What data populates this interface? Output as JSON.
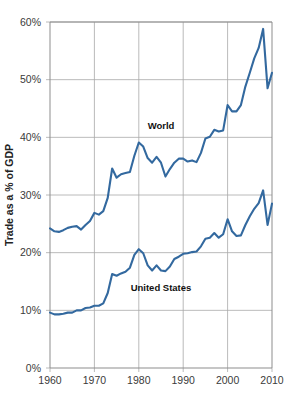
{
  "chart_data": {
    "type": "line",
    "title": "",
    "xlabel": "",
    "ylabel": "Trade as a % of GDP",
    "xlim": [
      1960,
      2010
    ],
    "ylim": [
      0,
      60
    ],
    "xticks": [
      1960,
      1970,
      1980,
      1990,
      2000,
      2010
    ],
    "xtick_labels": [
      "1960",
      "1970",
      "1980",
      "1990",
      "2000",
      "2010"
    ],
    "yticks": [
      0,
      10,
      20,
      30,
      40,
      50,
      60
    ],
    "ytick_labels": [
      "0%",
      "10%",
      "20%",
      "30%",
      "40%",
      "50%",
      "60%"
    ],
    "grid": true,
    "legend_position": "inline-annotations",
    "line_color": "#33699f",
    "series": [
      {
        "name": "World",
        "label": "World",
        "label_x": 1985,
        "label_y": 41.5,
        "x": [
          1960,
          1961,
          1962,
          1963,
          1964,
          1965,
          1966,
          1967,
          1968,
          1969,
          1970,
          1971,
          1972,
          1973,
          1974,
          1975,
          1976,
          1977,
          1978,
          1979,
          1980,
          1981,
          1982,
          1983,
          1984,
          1985,
          1986,
          1987,
          1988,
          1989,
          1990,
          1991,
          1992,
          1993,
          1994,
          1995,
          1996,
          1997,
          1998,
          1999,
          2000,
          2001,
          2002,
          2003,
          2004,
          2005,
          2006,
          2007,
          2008,
          2009,
          2010
        ],
        "values": [
          24.2,
          23.7,
          23.6,
          23.9,
          24.3,
          24.5,
          24.6,
          24.0,
          24.8,
          25.5,
          26.9,
          26.6,
          27.2,
          29.5,
          34.6,
          33.0,
          33.6,
          33.8,
          34.0,
          36.8,
          39.1,
          38.4,
          36.4,
          35.6,
          36.6,
          35.6,
          33.2,
          34.5,
          35.6,
          36.3,
          36.3,
          35.8,
          36.0,
          35.7,
          37.3,
          39.8,
          40.1,
          41.3,
          41.0,
          41.2,
          45.6,
          44.5,
          44.5,
          45.6,
          48.8,
          51.2,
          53.7,
          55.5,
          58.8,
          48.5,
          51.2
        ]
      },
      {
        "name": "United States",
        "label": "United States",
        "label_x": 1985,
        "label_y": 13.4,
        "x": [
          1960,
          1961,
          1962,
          1963,
          1964,
          1965,
          1966,
          1967,
          1968,
          1969,
          1970,
          1971,
          1972,
          1973,
          1974,
          1975,
          1976,
          1977,
          1978,
          1979,
          1980,
          1981,
          1982,
          1983,
          1984,
          1985,
          1986,
          1987,
          1988,
          1989,
          1990,
          1991,
          1992,
          1993,
          1994,
          1995,
          1996,
          1997,
          1998,
          1999,
          2000,
          2001,
          2002,
          2003,
          2004,
          2005,
          2006,
          2007,
          2008,
          2009,
          2010
        ],
        "values": [
          9.6,
          9.3,
          9.3,
          9.4,
          9.6,
          9.6,
          10.0,
          10.0,
          10.4,
          10.5,
          10.8,
          10.8,
          11.2,
          13.0,
          16.3,
          16.0,
          16.4,
          16.7,
          17.4,
          19.6,
          20.6,
          19.9,
          17.8,
          16.9,
          17.8,
          16.9,
          16.8,
          17.6,
          18.9,
          19.3,
          19.8,
          19.9,
          20.1,
          20.2,
          21.1,
          22.4,
          22.6,
          23.4,
          22.6,
          23.2,
          25.8,
          23.7,
          22.9,
          23.0,
          24.8,
          26.3,
          27.6,
          28.6,
          30.8,
          24.8,
          28.5
        ]
      }
    ]
  },
  "axis": {
    "y_title": "Trade as a % of GDP"
  }
}
